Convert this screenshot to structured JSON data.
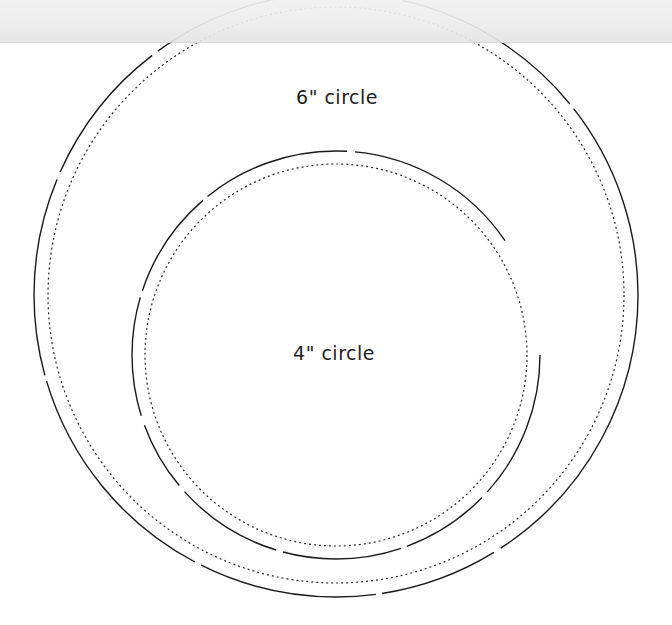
{
  "diagram": {
    "type": "circle-template",
    "circles": [
      {
        "id": "large",
        "label": "6\" circle",
        "center": [
          336,
          295
        ],
        "cut_line_radius": 302,
        "stitch_line_radius": 288,
        "cut_line_style": "solid",
        "stitch_line_style": "dotted"
      },
      {
        "id": "small",
        "label": "4\" circle",
        "center": [
          336,
          355
        ],
        "cut_line_radius": 204,
        "stitch_line_radius": 191,
        "cut_line_style": "solid",
        "stitch_line_style": "dotted"
      }
    ],
    "colors": {
      "line": "#1a1a1a",
      "background": "#ffffff",
      "top_band": "#ebebeb"
    }
  }
}
